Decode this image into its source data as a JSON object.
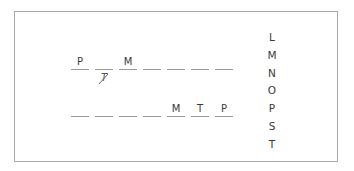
{
  "puzzle": {
    "row1": {
      "slots": [
        "P",
        "",
        "M",
        "",
        "",
        "",
        ""
      ],
      "crossed_out_below_slot_2": "T"
    },
    "row2": {
      "slots": [
        "",
        "",
        "",
        "",
        "M",
        "T",
        "P"
      ]
    },
    "letter_bank": [
      "L",
      "M",
      "N",
      "O",
      "P",
      "S",
      "T"
    ]
  }
}
